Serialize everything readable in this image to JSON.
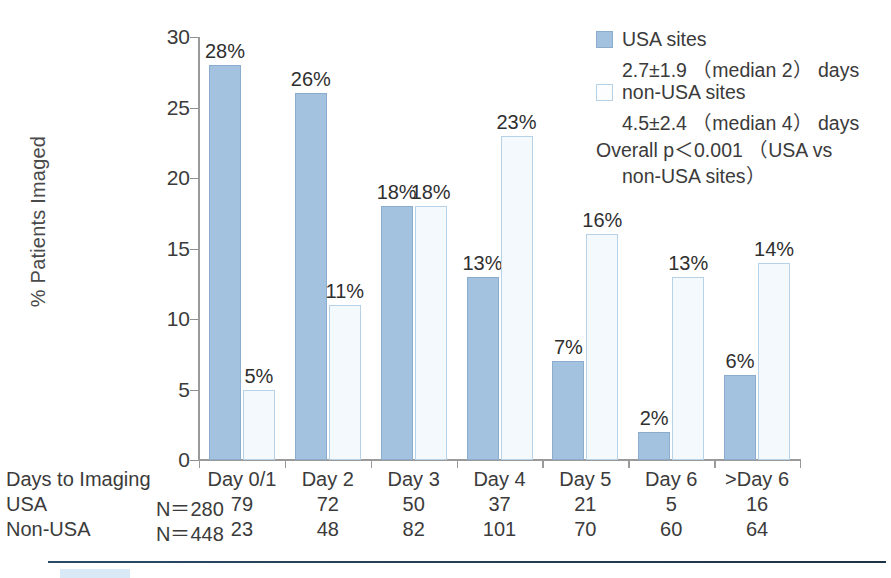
{
  "chart_data": {
    "type": "bar",
    "title": "",
    "xlabel": "Days to Imaging",
    "ylabel": "% Patients Imaged",
    "ylim": [
      0,
      30
    ],
    "yticks": [
      0,
      5,
      10,
      15,
      20,
      25,
      30
    ],
    "grid": false,
    "legend_position": "top-right",
    "categories": [
      "Day 0/1",
      "Day 2",
      "Day 3",
      "Day 4",
      "Day 5",
      "Day 6",
      ">Day 6"
    ],
    "series": [
      {
        "name": "USA sites",
        "values": [
          28,
          26,
          18,
          13,
          7,
          2,
          6
        ],
        "labels": [
          "28%",
          "26%",
          "18%",
          "13%",
          "7%",
          "2%",
          "6%"
        ],
        "color": "#a3c2e0",
        "n": 280,
        "counts": [
          79,
          72,
          50,
          37,
          21,
          5,
          16
        ],
        "summary": "2.7±1.9 （median 2） days"
      },
      {
        "name": "non-USA sites",
        "values": [
          5,
          11,
          18,
          23,
          16,
          13,
          14
        ],
        "labels": [
          "5%",
          "11%",
          "18%",
          "23%",
          "16%",
          "13%",
          "14%"
        ],
        "color": "#f3f9fd",
        "n": 448,
        "counts": [
          23,
          48,
          82,
          101,
          70,
          60,
          64
        ],
        "summary": "4.5±2.4 （median 4） days"
      }
    ],
    "annotations": [
      "Overall p＜0.001 （USA vs",
      "non-USA sites）"
    ]
  },
  "legend": {
    "series1_label": "USA sites",
    "series1_stats": "2.7±1.9 （median 2） days",
    "series2_label": "non-USA sites",
    "series2_stats": "4.5±2.4 （median 4） days",
    "pvalue_line1": "Overall p＜0.001 （USA vs",
    "pvalue_line2": "non-USA sites）"
  },
  "yaxis": {
    "title": "% Patients Imaged",
    "ticks": [
      "30",
      "25",
      "20",
      "15",
      "10",
      "5",
      "0"
    ]
  },
  "table": {
    "row1_label": "Days to Imaging",
    "row1_n": "",
    "row2_label": "USA",
    "row2_n": "N＝280",
    "row3_label": "Non-USA",
    "row3_n": "N＝448",
    "columns": [
      "Day 0/1",
      "Day 2",
      "Day 3",
      "Day 4",
      "Day 5",
      "Day 6",
      ">Day 6"
    ],
    "usa_counts": [
      "79",
      "72",
      "50",
      "37",
      "21",
      "5",
      "16"
    ],
    "nonusa_counts": [
      "23",
      "48",
      "82",
      "101",
      "70",
      "60",
      "64"
    ]
  },
  "bar_labels": {
    "usa": [
      "28%",
      "26%",
      "18%",
      "13%",
      "7%",
      "2%",
      "6%"
    ],
    "nonusa": [
      "5%",
      "11%",
      "18%",
      "23%",
      "16%",
      "13%",
      "14%"
    ]
  }
}
